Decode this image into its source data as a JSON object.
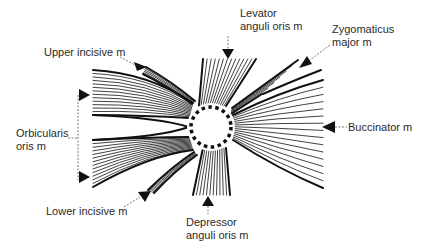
{
  "diagram": {
    "labels": {
      "levator": [
        "Levator",
        "anguli oris m"
      ],
      "zygomaticus": [
        "Zygomaticus",
        "major m"
      ],
      "upper_incisive": "Upper incisive m",
      "orbicularis": [
        "Orbicularis",
        "oris m"
      ],
      "buccinator": "Buccinator m",
      "lower_incisive": "Lower incisive m",
      "depressor": [
        "Depressor",
        "anguli  oris m"
      ]
    },
    "center": {
      "name": "modiolus",
      "x": 211,
      "y": 127,
      "r": 22
    },
    "colors": {
      "line": "#111111",
      "label": "#2a2a2a",
      "leader": "#555555"
    }
  }
}
